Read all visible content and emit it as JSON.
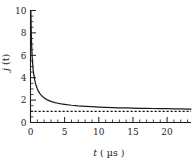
{
  "chart_data": {
    "type": "line",
    "title": "",
    "xlabel": "t ( µs )",
    "ylabel": "j (t)",
    "xlabel_symbol": "t",
    "xlabel_unit": "( µs )",
    "ylabel_symbol": "j",
    "ylabel_arg": "(t)",
    "xlim": [
      0,
      23.5
    ],
    "ylim": [
      0,
      10
    ],
    "xticks": [
      0,
      5,
      10,
      15,
      20
    ],
    "xtick_labels": [
      "0",
      "5",
      "10",
      "15",
      "20"
    ],
    "yticks": [
      0,
      2,
      4,
      6,
      8,
      10
    ],
    "ytick_labels": [
      "0",
      "2",
      "4",
      "6",
      "8",
      "10"
    ],
    "x_minor_step": 1,
    "y_minor_step": 0.5,
    "grid": false,
    "legend": "none",
    "tick_direction": "in",
    "colors": {
      "curve": "#1a1a1a",
      "asymptote": "#1a1a1a",
      "axis": "#1a1a1a",
      "background": "#ffffff"
    },
    "series": [
      {
        "name": "j (t)",
        "style": "solid",
        "x": [
          0.05,
          0.1,
          0.15,
          0.2,
          0.25,
          0.3,
          0.4,
          0.5,
          0.6,
          0.7,
          0.8,
          0.9,
          1.0,
          1.2,
          1.4,
          1.6,
          1.8,
          2.0,
          2.4,
          2.8,
          3.2,
          3.6,
          4.0,
          4.5,
          5.0,
          6.0,
          7.0,
          8.0,
          9.0,
          10.0,
          11.0,
          12.0,
          13.0,
          14.0,
          15.0,
          16.0,
          17.0,
          18.0,
          19.0,
          20.0,
          21.0,
          22.0,
          23.0,
          23.5
        ],
        "y": [
          10.0,
          8.4,
          7.2,
          6.4,
          5.8,
          5.35,
          4.65,
          4.2,
          3.85,
          3.58,
          3.35,
          3.17,
          3.0,
          2.75,
          2.56,
          2.42,
          2.3,
          2.2,
          2.04,
          1.93,
          1.84,
          1.77,
          1.72,
          1.66,
          1.62,
          1.54,
          1.48,
          1.44,
          1.41,
          1.38,
          1.35,
          1.33,
          1.31,
          1.3,
          1.28,
          1.27,
          1.26,
          1.25,
          1.24,
          1.23,
          1.22,
          1.21,
          1.2,
          1.2
        ]
      },
      {
        "name": "asymptote",
        "style": "dashed",
        "x": [
          0,
          23.5
        ],
        "y": [
          1.0,
          1.0
        ]
      }
    ],
    "annotations": []
  }
}
